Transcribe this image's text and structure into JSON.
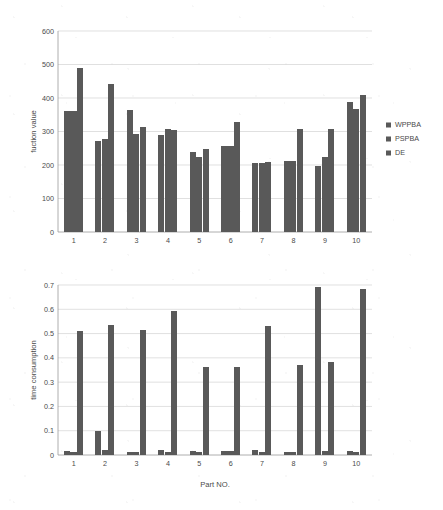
{
  "figure": {
    "background_color": "#ffffff",
    "bar_color": "#595959",
    "grid_color": "#d2d2d2",
    "axis_color": "#9a9a9a"
  },
  "legend": {
    "position": "right",
    "entries": [
      {
        "label": "WPPBA",
        "color": "#595959"
      },
      {
        "label": "PSPBA",
        "color": "#595959"
      },
      {
        "label": "DE",
        "color": "#595959"
      }
    ]
  },
  "chart_data": [
    {
      "id": "fuction-value-chart",
      "type": "bar",
      "title": "",
      "xlabel": "",
      "ylabel": "fuction value",
      "categories": [
        "1",
        "2",
        "3",
        "4",
        "5",
        "6",
        "7",
        "8",
        "9",
        "10"
      ],
      "ylim": [
        0,
        600
      ],
      "yticks": [
        0,
        100,
        200,
        300,
        400,
        500,
        600
      ],
      "ytick_labels": [
        "0",
        "100",
        "200",
        "300",
        "400",
        "500",
        "600"
      ],
      "grid": true,
      "legend": [
        "WPPBA",
        "PSPBA",
        "DE"
      ],
      "series": [
        {
          "name": "WPPBA",
          "values": [
            360,
            272,
            365,
            290,
            239,
            257,
            205,
            211,
            196,
            387
          ]
        },
        {
          "name": "PSPBA",
          "values": [
            360,
            278,
            294,
            307,
            224,
            257,
            205,
            211,
            225,
            367
          ]
        },
        {
          "name": "DE",
          "values": [
            490,
            442,
            313,
            304,
            247,
            327,
            209,
            308,
            308,
            409
          ]
        }
      ]
    },
    {
      "id": "time-consumption-chart",
      "type": "bar",
      "title": "",
      "xlabel": "Part NO.",
      "ylabel": "time consumption",
      "categories": [
        "1",
        "2",
        "3",
        "4",
        "5",
        "6",
        "7",
        "8",
        "9",
        "10"
      ],
      "ylim": [
        0,
        0.7
      ],
      "yticks": [
        0,
        0.1,
        0.2,
        0.3,
        0.4,
        0.5,
        0.6,
        0.7
      ],
      "ytick_labels": [
        "0",
        "0.1",
        "0.2",
        "0.3",
        "0.4",
        "0.5",
        "0.6",
        "0.7"
      ],
      "grid": true,
      "legend": [
        "WPPBA",
        "PSPBA",
        "DE"
      ],
      "series": [
        {
          "name": "WPPBA",
          "values": [
            0.015,
            0.1,
            0.014,
            0.022,
            0.015,
            0.016,
            0.022,
            0.013,
            0.69,
            0.015
          ]
        },
        {
          "name": "PSPBA",
          "values": [
            0.014,
            0.019,
            0.013,
            0.013,
            0.014,
            0.015,
            0.014,
            0.013,
            0.015,
            0.014
          ]
        },
        {
          "name": "DE",
          "values": [
            0.512,
            0.535,
            0.516,
            0.594,
            0.362,
            0.362,
            0.53,
            0.372,
            0.385,
            0.685
          ]
        }
      ]
    }
  ]
}
